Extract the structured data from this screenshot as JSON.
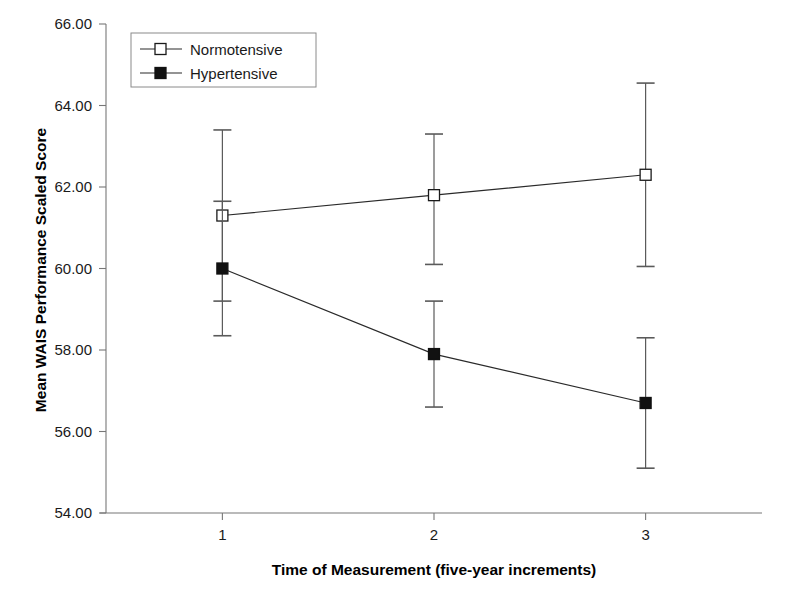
{
  "chart_data": {
    "type": "line",
    "title": "",
    "xlabel": "Time of Measurement (five-year increments)",
    "ylabel": "Mean WAIS Performance Scaled Score",
    "x": [
      1,
      2,
      3
    ],
    "xtick_labels": [
      "1",
      "2",
      "3"
    ],
    "xlim": [
      0.45,
      3.55
    ],
    "ylim": [
      54.0,
      66.0
    ],
    "ytick_labels": [
      "66.00",
      "64.00",
      "62.00",
      "60.00",
      "58.00",
      "56.00",
      "54.00"
    ],
    "ytick_values": [
      66.0,
      64.0,
      62.0,
      60.0,
      58.0,
      56.0,
      54.0
    ],
    "grid": false,
    "legend_position": "top-left-inside",
    "series": [
      {
        "name": "Normotensive",
        "marker": "open-square",
        "values": [
          61.3,
          61.8,
          62.3
        ],
        "error_upper": [
          63.4,
          63.3,
          64.55
        ],
        "error_lower": [
          59.2,
          60.1,
          60.05
        ]
      },
      {
        "name": "Hypertensive",
        "marker": "filled-square",
        "values": [
          60.0,
          57.9,
          56.7
        ],
        "error_upper": [
          61.65,
          59.2,
          58.3
        ],
        "error_lower": [
          58.35,
          56.6,
          55.1
        ]
      }
    ]
  },
  "legend": {
    "entries": [
      {
        "label": "Normotensive"
      },
      {
        "label": "Hypertensive"
      }
    ]
  },
  "colors": {
    "axis": "#777777",
    "line": "#2a2a2a",
    "marker_open_fill": "#ffffff",
    "marker_filled_fill": "#111111",
    "error_bar": "#5a5a5a",
    "background": "#ffffff",
    "text": "#1a1a1a"
  }
}
